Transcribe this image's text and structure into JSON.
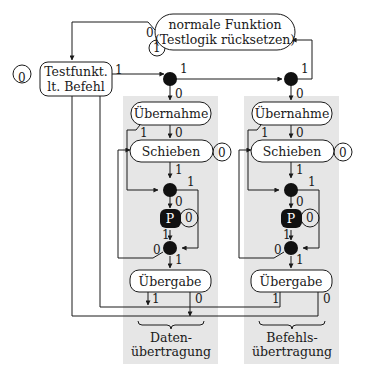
{
  "diagram": {
    "type": "state-machine",
    "states": {
      "normal": {
        "line1": "normale Funktion",
        "line2": "(Testlogik rücksetzen)",
        "self_loop": "1",
        "in_label": "0"
      },
      "testfunkt": {
        "line1": "Testfunkt.",
        "line2": "lt. Befehl",
        "self_loop": "0",
        "out_label": "1"
      },
      "uebernahme_left": {
        "label": "Übernahme"
      },
      "schieben_left": {
        "label": "Schieben",
        "self_loop": "0"
      },
      "pause_left": {
        "label": "P",
        "self_loop": "0"
      },
      "uebergabe_left": {
        "label": "Übergabe"
      },
      "uebernahme_right": {
        "label": "Übernahme"
      },
      "schieben_right": {
        "label": "Schieben",
        "self_loop": "0"
      },
      "pause_right": {
        "label": "P",
        "self_loop": "0"
      },
      "uebergabe_right": {
        "label": "Übergabe"
      }
    },
    "edge_labels": {
      "one": "1",
      "zero": "0"
    },
    "groups": {
      "left": {
        "line1": "Daten-",
        "line2": "übertragung"
      },
      "right": {
        "line1": "Befehls-",
        "line2": "übertragung"
      }
    },
    "colors": {
      "group_bg": "#e6e6e6",
      "node_fill": "#ffffff",
      "stroke": "#1a1a1a",
      "junction": "#111111"
    }
  }
}
